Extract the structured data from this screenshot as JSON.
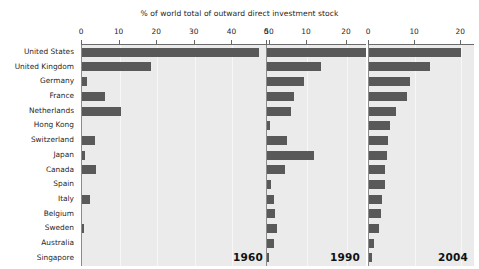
{
  "chart_data": {
    "type": "bar",
    "title": "% of world total of outward direct investment stock",
    "xlabel": "",
    "ylabel": "",
    "orientation": "horizontal",
    "grid": true,
    "legend_position": "none",
    "categories": [
      "United States",
      "United Kingdom",
      "Germany",
      "France",
      "Netherlands",
      "Hong Kong",
      "Switzerland",
      "Japan",
      "Canada",
      "Spain",
      "Italy",
      "Belgium",
      "Sweden",
      "Australia",
      "Singapore"
    ],
    "panels": [
      {
        "year": "1960",
        "xlim": [
          0,
          50
        ],
        "xticks": [
          0,
          10,
          20,
          30,
          40,
          50
        ],
        "values": [
          47.1,
          18.3,
          1.2,
          6.1,
          10.3,
          0.0,
          3.4,
          0.7,
          3.7,
          0.0,
          2.0,
          0.0,
          0.5,
          0.0,
          0.0
        ]
      },
      {
        "year": "1990",
        "xlim": [
          0,
          25
        ],
        "xticks": [
          0,
          10,
          20
        ],
        "values": [
          24.7,
          13.6,
          9.2,
          6.8,
          6.0,
          0.8,
          4.9,
          11.7,
          4.6,
          1.0,
          1.8,
          1.9,
          2.5,
          1.8,
          0.5
        ]
      },
      {
        "year": "2004",
        "xlim": [
          0,
          23
        ],
        "xticks": [
          0,
          10,
          20
        ],
        "values": [
          19.9,
          13.2,
          8.9,
          8.2,
          5.8,
          4.5,
          4.2,
          3.8,
          3.5,
          3.4,
          2.8,
          2.6,
          2.2,
          1.1,
          0.6
        ]
      }
    ],
    "colors": {
      "bar": "#595959",
      "plot_background": "#ebebeb",
      "figure_background": "#ffffff",
      "axis": "#6b6b6b",
      "text": "#1f1f1f"
    }
  }
}
